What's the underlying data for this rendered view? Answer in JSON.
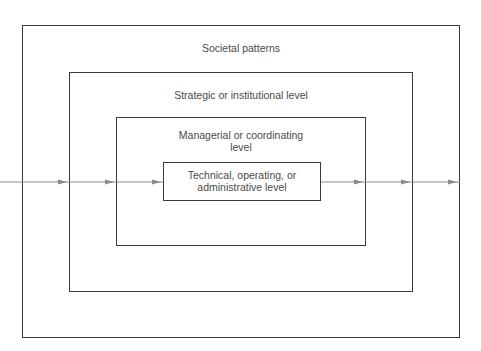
{
  "diagram": {
    "type": "nested-boxes-with-flow",
    "levels": [
      {
        "id": "societal",
        "label": "Societal patterns"
      },
      {
        "id": "strategic",
        "label": "Strategic or institutional level"
      },
      {
        "id": "managerial",
        "label_line1": "Managerial or coordinating",
        "label_line2": "level"
      },
      {
        "id": "technical",
        "label_line1": "Technical, operating, or",
        "label_line2": "administrative level"
      }
    ],
    "flow": {
      "direction": "left-to-right",
      "arrow_icon": "arrow-right-icon"
    },
    "colors": {
      "box_border": "#3a3a3a",
      "flow_line": "#8a8a8a",
      "text": "#4a4a4a"
    }
  }
}
